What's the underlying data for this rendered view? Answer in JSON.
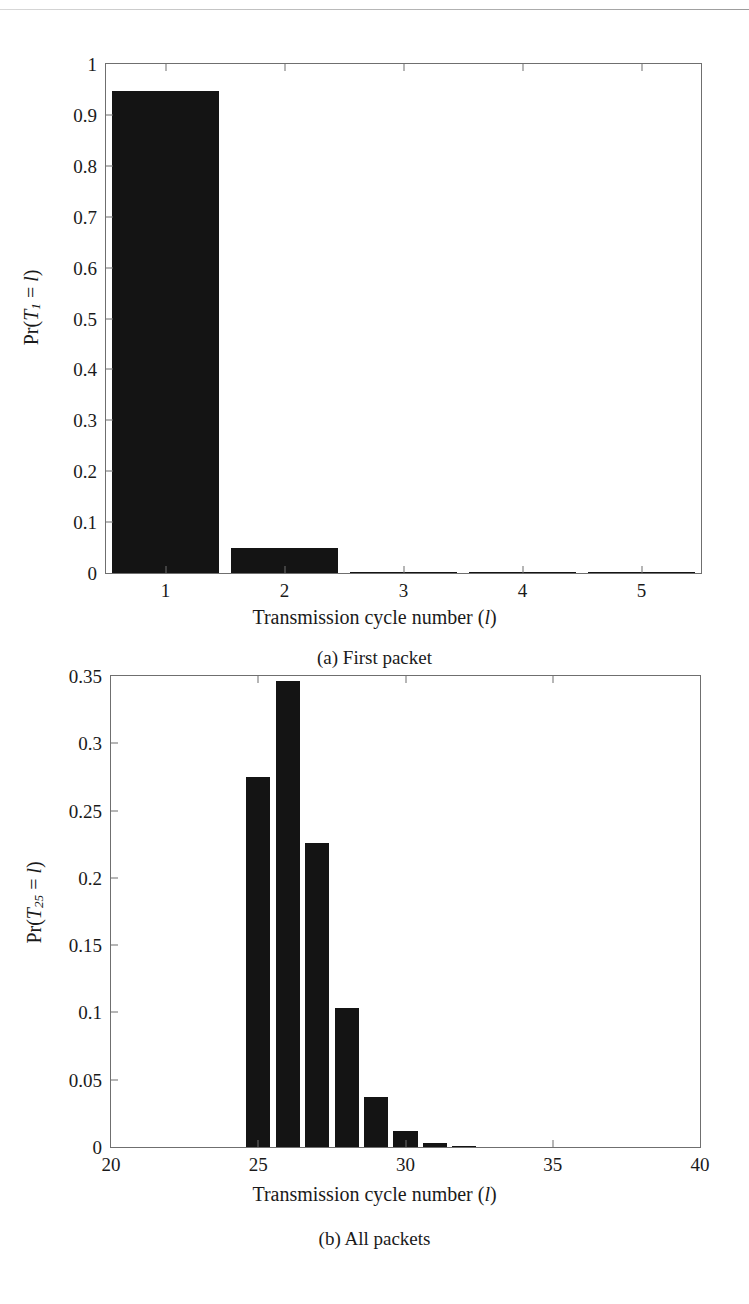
{
  "page": {
    "header_text": "",
    "background": "#ffffff",
    "ink_color": "#141414",
    "axis_color": "#6f6f6f"
  },
  "figures": [
    {
      "id": "a",
      "caption": "(a) First packet",
      "xlabel_prefix": "Transmission cycle number (",
      "xlabel_var": "l",
      "xlabel_suffix": ")",
      "ylabel_prefix": "Pr(",
      "ylabel_var": "T",
      "ylabel_sub": "1",
      "ylabel_mid": " = ",
      "ylabel_var2": "l",
      "ylabel_suffix": ")"
    },
    {
      "id": "b",
      "caption": "(b) All packets",
      "xlabel_prefix": "Transmission cycle number (",
      "xlabel_var": "l",
      "xlabel_suffix": ")",
      "ylabel_prefix": "Pr(",
      "ylabel_var": "T",
      "ylabel_sub": "25",
      "ylabel_mid": " = ",
      "ylabel_var2": "l",
      "ylabel_suffix": ")"
    }
  ],
  "chart_data": [
    {
      "type": "bar",
      "title": "(a) First packet",
      "xlabel": "Transmission cycle number (l)",
      "ylabel": "Pr(T_1 = l)",
      "categories": [
        1,
        2,
        3,
        4,
        5
      ],
      "x": [
        1,
        2,
        3,
        4,
        5
      ],
      "values": [
        0.947,
        0.05,
        0.0025,
        0.0002,
        0.0
      ],
      "xlim": [
        0.5,
        5.5
      ],
      "ylim": [
        0,
        1
      ],
      "xticks": [
        "1",
        "2",
        "3",
        "4",
        "5"
      ],
      "yticks": [
        "0",
        "0.1",
        "0.2",
        "0.3",
        "0.4",
        "0.5",
        "0.6",
        "0.7",
        "0.8",
        "0.9",
        "1"
      ],
      "ytick_values": [
        0,
        0.1,
        0.2,
        0.3,
        0.4,
        0.5,
        0.6,
        0.7,
        0.8,
        0.9,
        1
      ],
      "bar_width": 0.9,
      "bar_color": "#141414",
      "grid": false,
      "legend": "none"
    },
    {
      "type": "bar",
      "title": "(b) All packets",
      "xlabel": "Transmission cycle number (l)",
      "ylabel": "Pr(T_25 = l)",
      "categories": [
        25,
        26,
        27,
        28,
        29,
        30,
        31,
        32
      ],
      "x": [
        25,
        26,
        27,
        28,
        29,
        30,
        31,
        32
      ],
      "values": [
        0.275,
        0.346,
        0.226,
        0.103,
        0.037,
        0.012,
        0.003,
        0.001
      ],
      "xlim": [
        20,
        40
      ],
      "ylim": [
        0,
        0.35
      ],
      "xticks": [
        "20",
        "25",
        "30",
        "35",
        "40"
      ],
      "xtick_values": [
        20,
        25,
        30,
        35,
        40
      ],
      "yticks": [
        "0",
        "0.05",
        "0.1",
        "0.15",
        "0.2",
        "0.25",
        "0.3",
        "0.35"
      ],
      "ytick_values": [
        0,
        0.05,
        0.1,
        0.15,
        0.2,
        0.25,
        0.3,
        0.35
      ],
      "bar_width": 0.82,
      "bar_color": "#141414",
      "grid": false,
      "legend": "none"
    }
  ]
}
